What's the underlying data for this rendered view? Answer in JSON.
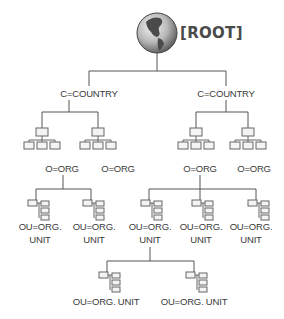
{
  "diagram": {
    "type": "directory-tree",
    "root": {
      "label": "[ROOT]",
      "icon": "globe-icon"
    },
    "countries": [
      {
        "label": "C=COUNTRY",
        "orgs": [
          {
            "label": "O=ORG",
            "units": [
              {
                "label_line1": "OU=ORG.",
                "label_line2": "UNIT"
              },
              {
                "label_line1": "OU=ORG.",
                "label_line2": "UNIT"
              }
            ]
          },
          {
            "label": "O=ORG",
            "units": []
          }
        ]
      },
      {
        "label": "C=COUNTRY",
        "orgs": [
          {
            "label": "O=ORG",
            "units": [
              {
                "label_line1": "OU=ORG.",
                "label_line2": "UNIT",
                "subunits": [
                  {
                    "label": "OU=ORG. UNIT"
                  },
                  {
                    "label": "OU=ORG. UNIT"
                  }
                ]
              },
              {
                "label_line1": "OU=ORG.",
                "label_line2": "UNIT"
              },
              {
                "label_line1": "OU=ORG.",
                "label_line2": "UNIT"
              }
            ]
          },
          {
            "label": "O=ORG",
            "units": []
          }
        ]
      }
    ],
    "colors": {
      "line": "#555555",
      "text": "#3a3a3a",
      "box": "#888888",
      "globe_ocean": "#9a9a9a",
      "globe_land": "#4a4a4a"
    }
  }
}
